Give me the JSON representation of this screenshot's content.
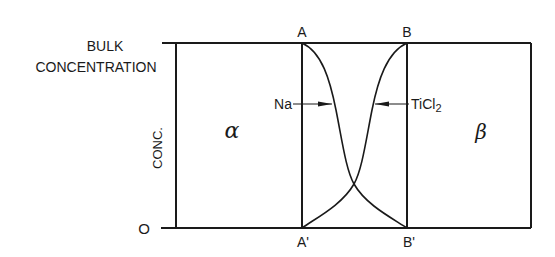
{
  "diagram": {
    "type": "concentration-profile",
    "y_axis": {
      "top_label_line1": "BULK",
      "top_label_line2": "CONCENTRATION",
      "axis_label": "CONC.",
      "zero_label": "O"
    },
    "boundaries": {
      "top_left": "A",
      "top_right": "B",
      "bottom_left": "A'",
      "bottom_right": "B'"
    },
    "phases": {
      "left": "α",
      "right": "β"
    },
    "species": {
      "left": "Na",
      "right": "TiCl",
      "right_subscript": "2"
    },
    "colors": {
      "line": "#1a1a1a",
      "background": "#ffffff"
    }
  }
}
